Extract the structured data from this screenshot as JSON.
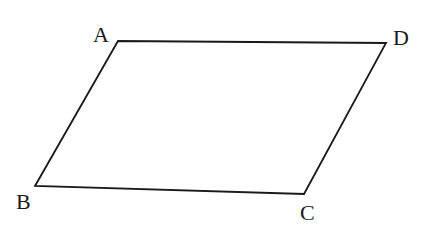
{
  "diagram": {
    "type": "geometry-figure",
    "shape": "parallelogram",
    "name": "ABCD",
    "stroke_color": "#1a1a1a",
    "background": "#ffffff",
    "vertices": [
      {
        "id": "A",
        "label": "A",
        "x": 118,
        "y": 41,
        "label_x": 93,
        "label_y": 42
      },
      {
        "id": "B",
        "label": "B",
        "x": 35,
        "y": 186,
        "label_x": 16,
        "label_y": 209
      },
      {
        "id": "C",
        "label": "C",
        "x": 304,
        "y": 194,
        "label_x": 300,
        "label_y": 220
      },
      {
        "id": "D",
        "label": "D",
        "x": 386,
        "y": 43,
        "label_x": 393,
        "label_y": 45
      }
    ],
    "edges": [
      {
        "from": "A",
        "to": "D"
      },
      {
        "from": "D",
        "to": "C"
      },
      {
        "from": "C",
        "to": "B"
      },
      {
        "from": "B",
        "to": "A"
      }
    ]
  }
}
